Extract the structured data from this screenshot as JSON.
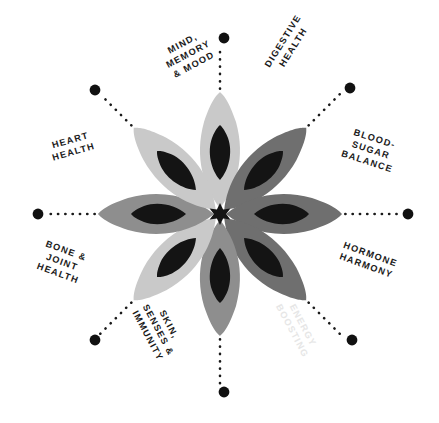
{
  "diagram": {
    "type": "radial-wheel",
    "title": "",
    "center_graphic": "eight-petal-flower",
    "spoke_count": 8,
    "center": {
      "x": 220,
      "y": 214
    },
    "colors": {
      "background": "#ffffff",
      "text": "#1a1a1a",
      "dot": "#111111",
      "dotted_line": "#1a1a1a",
      "petal_light": "#c9c9c9",
      "petal_mid": "#8e8e8e",
      "petal_dark": "#6f6f6f",
      "petal_inner": "#141414",
      "watermark": "#e8e8e8"
    },
    "spokes": [
      {
        "id": "mind-memory-mood",
        "label": "MIND,\nMEMORY\n& MOOD",
        "angle_deg": 270,
        "dot": {
          "x": 224,
          "y": 38
        },
        "label_pos": {
          "x": 164,
          "y": 36
        },
        "label_rotation_deg": -28
      },
      {
        "id": "digestive-health",
        "label": "DIGESTIVE\nHEALTH",
        "angle_deg": 315,
        "dot": {
          "x": 350,
          "y": 88
        },
        "label_pos": {
          "x": 258,
          "y": 32
        },
        "label_rotation_deg": -58
      },
      {
        "id": "blood-sugar-balance",
        "label": "BLOOD-\nSUGAR\nBALANCE",
        "angle_deg": 0,
        "dot": {
          "x": 408,
          "y": 214
        },
        "label_pos": {
          "x": 344,
          "y": 132
        },
        "label_rotation_deg": 18
      },
      {
        "id": "hormone-harmony",
        "label": "HORMONE\nHARMONY",
        "angle_deg": 45,
        "dot": {
          "x": 352,
          "y": 340
        },
        "label_pos": {
          "x": 340,
          "y": 248
        },
        "label_rotation_deg": 20
      },
      {
        "id": "energy-boosting",
        "label": "ENERGY\nBOOSTING",
        "angle_deg": 90,
        "dot": {
          "x": 224,
          "y": 392
        },
        "label_pos": {
          "x": 268,
          "y": 316
        },
        "label_rotation_deg": 62,
        "style": "watermark"
      },
      {
        "id": "skin-senses-immunity",
        "label": "SKIN,\nSENSES &\nIMMUNITY",
        "angle_deg": 135,
        "dot": {
          "x": 95,
          "y": 340
        },
        "label_pos": {
          "x": 130,
          "y": 312
        },
        "label_rotation_deg": 62
      },
      {
        "id": "bone-joint-health",
        "label": "BONE &\nJOINT\nHEALTH",
        "angle_deg": 180,
        "dot": {
          "x": 38,
          "y": 214
        },
        "label_pos": {
          "x": 40,
          "y": 244
        },
        "label_rotation_deg": 20
      },
      {
        "id": "heart-health",
        "label": "HEART\nHEALTH",
        "angle_deg": 225,
        "dot": {
          "x": 95,
          "y": 90
        },
        "label_pos": {
          "x": 50,
          "y": 134
        },
        "label_rotation_deg": -16
      }
    ]
  }
}
